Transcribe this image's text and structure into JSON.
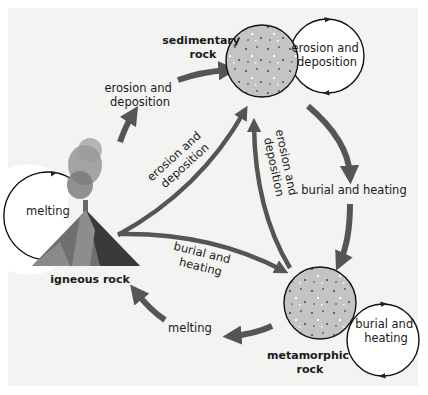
{
  "diagram": {
    "nodes": {
      "sedimentary": {
        "line1": "sedimentary",
        "line2": "rock"
      },
      "metamorphic": {
        "line1": "metamorphic",
        "line2": "rock"
      },
      "igneous": {
        "label": "igneous rock"
      }
    },
    "self_loops": {
      "sedimentary": {
        "line1": "erosion and",
        "line2": "deposition"
      },
      "metamorphic": {
        "line1": "burial and",
        "line2": "heating"
      },
      "igneous": {
        "label": "melting"
      }
    },
    "edges": {
      "igneous_to_sedimentary_outer": {
        "line1": "erosion and",
        "line2": "deposition"
      },
      "igneous_to_sedimentary_inner": {
        "line1": "erosion and",
        "line2": "deposition"
      },
      "metamorphic_to_sedimentary": {
        "line1": "erosion and",
        "line2": "deposition"
      },
      "sedimentary_to_metamorphic": {
        "label": "burial and heating"
      },
      "igneous_to_metamorphic": {
        "line1": "burial and",
        "line2": "heating"
      },
      "metamorphic_to_igneous": {
        "label": "melting"
      }
    },
    "colors": {
      "background": "#f3f3f1",
      "arrow": "#555555",
      "rock_fill": "#c4c4c4",
      "loop_fill": "#ffffff",
      "text": "#1a1a1a"
    }
  }
}
